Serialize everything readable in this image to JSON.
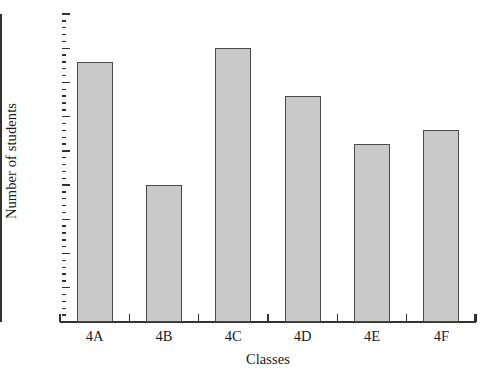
{
  "chart_data": {
    "type": "bar",
    "title": "",
    "subtitle": "",
    "xlabel": "Classes",
    "ylabel": "Number of students",
    "categories": [
      "4A",
      "4B",
      "4C",
      "4D",
      "4E",
      "4F"
    ],
    "values": [
      38,
      20,
      40,
      33,
      26,
      28
    ],
    "ylim": [
      0,
      45
    ],
    "y_major_ticks": [
      0,
      5,
      10,
      15,
      20,
      25,
      30,
      35,
      40,
      45
    ],
    "y_tick_labels": [
      "0",
      "5",
      "10",
      "15",
      "20",
      "25",
      "30",
      "35",
      "40",
      "45"
    ],
    "y_minor_tick_step": 1,
    "grid": false,
    "legend": false,
    "legend_position": "none",
    "bar_fill_color": "#c9c9c9",
    "bar_edge_color": "#4a4a48",
    "axis_color": "#33322f",
    "background_color": "#ffffff"
  }
}
